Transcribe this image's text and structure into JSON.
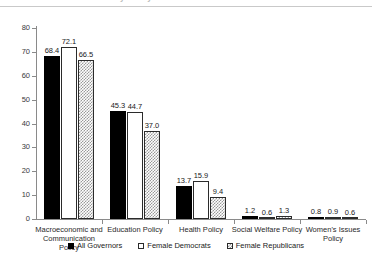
{
  "title": {
    "text": "Issue Attention by Policy Area",
    "clipped": true
  },
  "chart_data": {
    "type": "bar",
    "title": "Issue Attention by Policy Area",
    "xlabel": "",
    "ylabel": "",
    "ylim": [
      0,
      80
    ],
    "ytick_labels": [
      "0",
      "10",
      "20",
      "30",
      "40",
      "50",
      "60",
      "70",
      "80"
    ],
    "yticks": [
      0,
      10,
      20,
      30,
      40,
      50,
      60,
      70,
      80
    ],
    "grid": false,
    "legend_position": "bottom",
    "categories": [
      "Macroeconomic and Communication Policy",
      "Education Policy",
      "Health Policy",
      "Social Welfare Policy",
      "Women's Issues Policy"
    ],
    "category_lines": [
      [
        "Macroeconomic and",
        "Communication Policy"
      ],
      [
        "Education Policy"
      ],
      [
        "Health Policy"
      ],
      [
        "Social Welfare Policy"
      ],
      [
        "Women's Issues Policy"
      ]
    ],
    "series": [
      {
        "name": "All Governors",
        "style": "solid-black",
        "color": "#000000",
        "values": [
          68.4,
          45.3,
          13.7,
          1.2,
          0.8
        ],
        "labels": [
          "68.4",
          "45.3",
          "13.7",
          "1.2",
          "0.8"
        ]
      },
      {
        "name": "Female Democrats",
        "style": "open-white",
        "color": "#ffffff",
        "values": [
          72.1,
          44.7,
          15.9,
          0.6,
          0.9
        ],
        "labels": [
          "72.1",
          "44.7",
          "15.9",
          "0.6",
          "0.9"
        ]
      },
      {
        "name": "Female Republicans",
        "style": "hatched-gray",
        "color": "#9a9a9a",
        "values": [
          66.5,
          37.0,
          9.4,
          1.3,
          0.6
        ],
        "labels": [
          "66.5",
          "37.0",
          "9.4",
          "1.3",
          "0.6"
        ]
      }
    ]
  },
  "legend": {
    "items": [
      {
        "label": "All Governors",
        "style": "s-all"
      },
      {
        "label": "Female Democrats",
        "style": "s-dem"
      },
      {
        "label": "Female Republicans",
        "style": "s-rep"
      }
    ]
  }
}
